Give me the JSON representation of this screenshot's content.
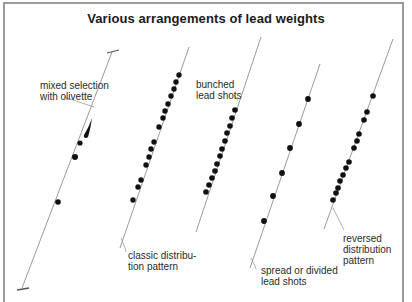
{
  "title": "Various arrangements of lead weights",
  "colors": {
    "line": "#9a9a9a",
    "weight": "#111111",
    "text": "#2a2a2a",
    "frame": "#9a9a9a"
  },
  "arrangements": [
    {
      "id": "mixed",
      "label_line1": "mixed selection",
      "label_line2": "with olivette"
    },
    {
      "id": "classic",
      "label_line1": "classic distribu-",
      "label_line2": "tion pattern"
    },
    {
      "id": "bunched",
      "label_line1": "bunched",
      "label_line2": "lead shots"
    },
    {
      "id": "spread",
      "label_line1": "spread or divided",
      "label_line2": "lead shots"
    },
    {
      "id": "reversed",
      "label_line1": "reversed",
      "label_line2": "distribution",
      "label_line3": "pattern"
    }
  ]
}
